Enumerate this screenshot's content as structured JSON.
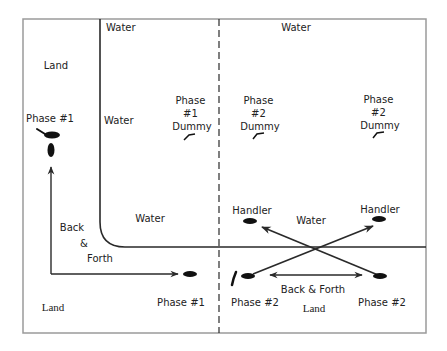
{
  "diagram": {
    "colors": {
      "frame": "#9a9a9a",
      "line": "#2a2a2a",
      "text": "#222222",
      "background": "#ffffff"
    },
    "labels": {
      "land_top_left": "Land",
      "water_top_left": "Water",
      "water_top_right": "Water",
      "water_mid_left": "Water",
      "water_lower_left": "Water",
      "water_lower_right": "Water",
      "land_bottom_left": "Land",
      "land_bottom_right": "Land",
      "phase1_top": "Phase #1",
      "phase1_bottom": "Phase #1",
      "phase2_bottom_left": "Phase #2",
      "phase2_bottom_right": "Phase #2",
      "back_forth_left": [
        "Back",
        "&",
        "Forth"
      ],
      "back_forth_right": "Back & Forth",
      "handler_left": "Handler",
      "handler_right": "Handler",
      "dummy_phase1": [
        "Phase",
        "#1",
        "Dummy"
      ],
      "dummy_phase2_left": [
        "Phase",
        "#2",
        "Dummy"
      ],
      "dummy_phase2_right": [
        "Phase",
        "#2",
        "Dummy"
      ]
    },
    "icons": [
      "dog-icon",
      "handler-icon",
      "dummy-icon",
      "arrow-icon"
    ]
  }
}
